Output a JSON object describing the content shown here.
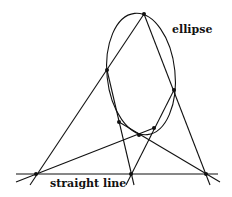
{
  "diagram": {
    "labels": {
      "ellipse": "ellipse",
      "line": "straight line"
    },
    "colors": {
      "stroke": "#111111",
      "background": "#ffffff"
    }
  }
}
